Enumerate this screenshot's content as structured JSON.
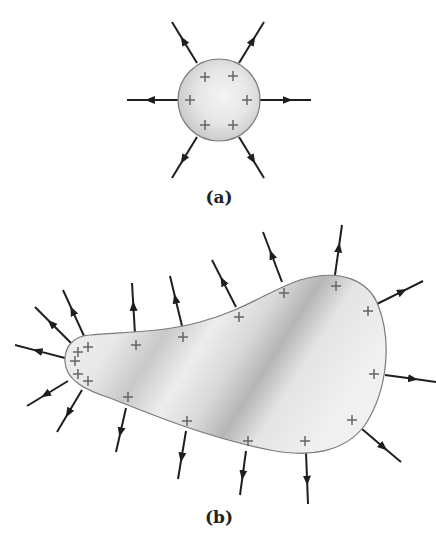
{
  "panels": [
    {
      "id": "a",
      "caption": "(a)",
      "shape": "circle",
      "description": "Charged conducting sphere with uniformly distributed positive charges; electric field lines radiate outward uniformly",
      "charges": [
        {
          "x": 205,
          "y": 77
        },
        {
          "x": 233,
          "y": 76
        },
        {
          "x": 190,
          "y": 100
        },
        {
          "x": 247,
          "y": 100
        },
        {
          "x": 205,
          "y": 125
        },
        {
          "x": 233,
          "y": 125
        }
      ],
      "field_lines": [
        {
          "x1": 197,
          "y1": 63,
          "x2": 172,
          "y2": 22
        },
        {
          "x1": 239,
          "y1": 63,
          "x2": 264,
          "y2": 22
        },
        {
          "x1": 178,
          "y1": 100,
          "x2": 127,
          "y2": 100
        },
        {
          "x1": 259,
          "y1": 100,
          "x2": 311,
          "y2": 100
        },
        {
          "x1": 197,
          "y1": 137,
          "x2": 172,
          "y2": 178
        },
        {
          "x1": 239,
          "y1": 137,
          "x2": 264,
          "y2": 178
        }
      ]
    },
    {
      "id": "b",
      "caption": "(b)",
      "shape": "irregular-conductor",
      "description": "Irregularly shaped charged conductor; charge density and field lines concentrated at the sharply curved left tip",
      "charges": [
        {
          "x": 78,
          "y": 352
        },
        {
          "x": 88,
          "y": 347
        },
        {
          "x": 75,
          "y": 361
        },
        {
          "x": 78,
          "y": 374
        },
        {
          "x": 88,
          "y": 381
        },
        {
          "x": 136,
          "y": 345
        },
        {
          "x": 183,
          "y": 337
        },
        {
          "x": 239,
          "y": 317
        },
        {
          "x": 284,
          "y": 293
        },
        {
          "x": 336,
          "y": 286
        },
        {
          "x": 368,
          "y": 311
        },
        {
          "x": 374,
          "y": 374
        },
        {
          "x": 352,
          "y": 420
        },
        {
          "x": 128,
          "y": 397
        },
        {
          "x": 187,
          "y": 421
        },
        {
          "x": 248,
          "y": 441
        },
        {
          "x": 305,
          "y": 441
        }
      ],
      "field_lines": [
        {
          "x1": 65,
          "y1": 358,
          "x2": 15,
          "y2": 345
        },
        {
          "x1": 71,
          "y1": 343,
          "x2": 35,
          "y2": 307
        },
        {
          "x1": 84,
          "y1": 336,
          "x2": 63,
          "y2": 290
        },
        {
          "x1": 68,
          "y1": 381,
          "x2": 27,
          "y2": 406
        },
        {
          "x1": 82,
          "y1": 390,
          "x2": 57,
          "y2": 432
        },
        {
          "x1": 135,
          "y1": 334,
          "x2": 132,
          "y2": 283
        },
        {
          "x1": 182,
          "y1": 326,
          "x2": 170,
          "y2": 276
        },
        {
          "x1": 236,
          "y1": 307,
          "x2": 212,
          "y2": 260
        },
        {
          "x1": 282,
          "y1": 282,
          "x2": 263,
          "y2": 232
        },
        {
          "x1": 335,
          "y1": 275,
          "x2": 342,
          "y2": 225
        },
        {
          "x1": 377,
          "y1": 304,
          "x2": 423,
          "y2": 281
        },
        {
          "x1": 385,
          "y1": 375,
          "x2": 436,
          "y2": 382
        },
        {
          "x1": 362,
          "y1": 429,
          "x2": 401,
          "y2": 462
        },
        {
          "x1": 126,
          "y1": 408,
          "x2": 116,
          "y2": 452
        },
        {
          "x1": 186,
          "y1": 431,
          "x2": 178,
          "y2": 479
        },
        {
          "x1": 246,
          "y1": 451,
          "x2": 240,
          "y2": 495
        },
        {
          "x1": 306,
          "y1": 452,
          "x2": 308,
          "y2": 504
        }
      ]
    }
  ],
  "colors": {
    "line": "#1e1e1e",
    "outline": "#7a7a7a",
    "fill_light": "#f2f2f2",
    "fill_dark": "#b8b8b8",
    "charge": "#666666"
  }
}
